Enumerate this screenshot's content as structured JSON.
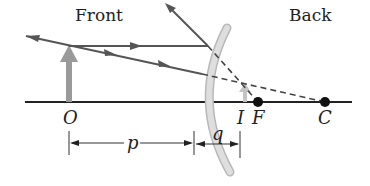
{
  "diagram": {
    "type": "convex-mirror-ray-diagram",
    "labels": {
      "front": "Front",
      "back": "Back",
      "object_point": "O",
      "image_point": "I",
      "focal_point": "F",
      "center_of_curvature": "C",
      "object_distance": "p",
      "image_distance": "q"
    },
    "colors": {
      "ray": "#555555",
      "axis": "#222222",
      "mirror": "#d6d6d6",
      "mirror_edge": "#b8b8b8",
      "object_arrow": "#9a9a9a",
      "image_arrow": "#c4c4c4",
      "dashed": "#444444",
      "point": "#111111"
    }
  }
}
